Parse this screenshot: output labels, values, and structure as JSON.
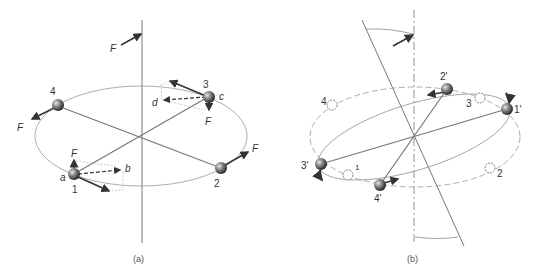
{
  "panel_a": {
    "caption": "(a)",
    "force_label": "F",
    "masses": [
      {
        "id": "1",
        "label": "1",
        "point": "a"
      },
      {
        "id": "2",
        "label": "2"
      },
      {
        "id": "3",
        "label": "3",
        "point": "c"
      },
      {
        "id": "4",
        "label": "4"
      }
    ],
    "vector_labels": {
      "b": "b",
      "d": "d",
      "a": "a",
      "c": "c"
    },
    "forces": [
      "F",
      "F",
      "F",
      "F",
      "F"
    ]
  },
  "panel_b": {
    "caption": "(b)",
    "masses_new": [
      {
        "id": "1p",
        "label": "1'"
      },
      {
        "id": "2p",
        "label": "2'"
      },
      {
        "id": "3p",
        "label": "3'"
      },
      {
        "id": "4p",
        "label": "4'"
      }
    ],
    "masses_old": [
      {
        "id": "1",
        "label": "1"
      },
      {
        "id": "2",
        "label": "2"
      },
      {
        "id": "3",
        "label": "3"
      },
      {
        "id": "4",
        "label": "4"
      }
    ]
  },
  "colors": {
    "line": "#8a8a8a",
    "dark": "#333333",
    "sphere": "#555555"
  }
}
